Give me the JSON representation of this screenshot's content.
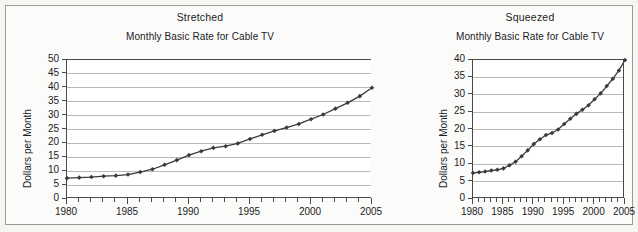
{
  "figure": {
    "background_color": "#f5f5f3",
    "frame_color": "#9a9a96",
    "panels": [
      {
        "key": "stretched",
        "heading": "Stretched",
        "subtitle": "Monthly Basic Rate for Cable TV"
      },
      {
        "key": "squeezed",
        "heading": "Squeezed",
        "subtitle": "Monthly Basic Rate for Cable TV"
      }
    ]
  },
  "chart_data": [
    {
      "type": "line",
      "title": "Monthly Basic Rate for Cable TV",
      "panel_label": "Stretched",
      "xlabel": "",
      "ylabel": "Dollars per Month",
      "xlim": [
        1980,
        2005
      ],
      "ylim": [
        0,
        50
      ],
      "ytick_values": [
        0,
        5,
        10,
        15,
        20,
        25,
        30,
        35,
        40,
        45,
        50
      ],
      "ytick_labels": [
        "0",
        "5",
        "10",
        "15",
        "20",
        "25",
        "30",
        "35",
        "40",
        "45",
        "50"
      ],
      "xtick_values": [
        1980,
        1985,
        1990,
        1995,
        2000,
        2005
      ],
      "xtick_labels": [
        "1980",
        "1985",
        "1990",
        "1995",
        "2000",
        "2005"
      ],
      "x_minor_tick_step": 1,
      "grid": "horizontal",
      "legend": "none",
      "marker": "diamond",
      "line_color": "#3a3a3a",
      "x": [
        1980,
        1981,
        1982,
        1983,
        1984,
        1985,
        1986,
        1987,
        1988,
        1989,
        1990,
        1991,
        1992,
        1993,
        1994,
        1995,
        1996,
        1997,
        1998,
        1999,
        2000,
        2001,
        2002,
        2003,
        2004,
        2005
      ],
      "values": [
        7.5,
        7.7,
        7.9,
        8.2,
        8.4,
        8.8,
        9.7,
        10.7,
        12.3,
        14.0,
        15.8,
        17.2,
        18.4,
        19.0,
        20.0,
        21.6,
        23.1,
        24.5,
        25.7,
        27.0,
        28.7,
        30.4,
        32.5,
        34.6,
        37.0,
        40.0
      ]
    },
    {
      "type": "line",
      "title": "Monthly Basic Rate for Cable TV",
      "panel_label": "Squeezed",
      "xlabel": "",
      "ylabel": "Dollars per Month",
      "xlim": [
        1980,
        2005
      ],
      "ylim": [
        0,
        40
      ],
      "ytick_values": [
        0,
        5,
        10,
        15,
        20,
        25,
        30,
        35,
        40
      ],
      "ytick_labels": [
        "0",
        "5",
        "10",
        "15",
        "20",
        "25",
        "30",
        "35",
        "40"
      ],
      "xtick_values": [
        1980,
        1985,
        1990,
        1995,
        2000,
        2005
      ],
      "xtick_labels": [
        "1980",
        "1985",
        "1990",
        "1995",
        "2000",
        "2005"
      ],
      "x_minor_tick_step": 1,
      "grid": "horizontal",
      "legend": "none",
      "marker": "diamond",
      "line_color": "#3a3a3a",
      "x": [
        1980,
        1981,
        1982,
        1983,
        1984,
        1985,
        1986,
        1987,
        1988,
        1989,
        1990,
        1991,
        1992,
        1993,
        1994,
        1995,
        1996,
        1997,
        1998,
        1999,
        2000,
        2001,
        2002,
        2003,
        2004,
        2005
      ],
      "values": [
        7.5,
        7.7,
        7.9,
        8.2,
        8.4,
        8.8,
        9.7,
        10.7,
        12.3,
        14.0,
        15.8,
        17.2,
        18.4,
        19.0,
        20.0,
        21.6,
        23.1,
        24.5,
        25.7,
        27.0,
        28.7,
        30.4,
        32.5,
        34.6,
        37.0,
        40.0
      ]
    }
  ]
}
